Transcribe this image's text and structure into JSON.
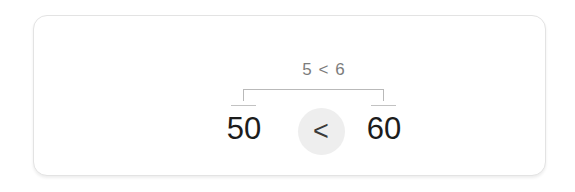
{
  "card": {
    "background_color": "#ffffff",
    "border_color": "#e3e3e3"
  },
  "comparison": {
    "expression_label": "5 < 6",
    "left_value": "50",
    "right_value": "60",
    "operator": "<",
    "operator_icon": "less-than-chevron-icon",
    "operator_badge_color": "#eeeeee",
    "bracket_color": "#b9b9b9",
    "number_color": "#1c1c1c",
    "expression_color": "#7c7c7c"
  }
}
